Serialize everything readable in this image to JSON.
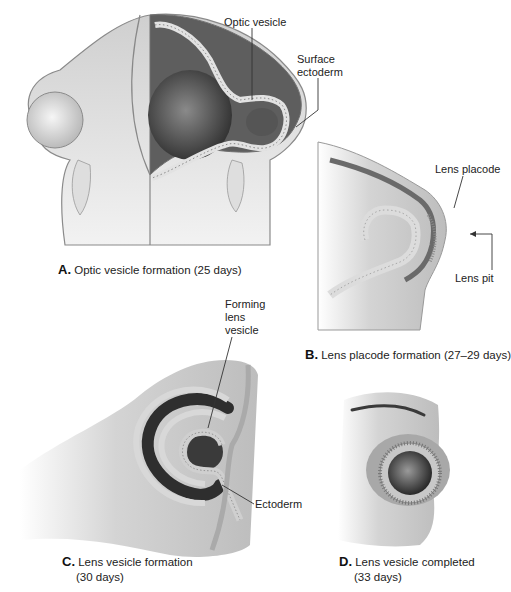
{
  "figure": {
    "panels": [
      {
        "id": "A",
        "letter": "A.",
        "caption": "Optic vesicle formation (25 days)",
        "labels": [
          "Optic vesicle",
          "Surface",
          "ectoderm"
        ]
      },
      {
        "id": "B",
        "letter": "B.",
        "caption": "Lens placode formation (27–29 days)",
        "labels": [
          "Lens placode",
          "Lens pit"
        ]
      },
      {
        "id": "C",
        "letter": "C.",
        "caption_line1": "Lens vesicle formation",
        "caption_line2": "(30 days)",
        "labels": [
          "Forming",
          "lens",
          "vesicle",
          "Ectoderm"
        ]
      },
      {
        "id": "D",
        "letter": "D.",
        "caption_line1": "Lens vesicle completed",
        "caption_line2": "(33 days)",
        "labels": []
      }
    ]
  },
  "colors": {
    "background": "#ffffff",
    "tissue_light": "#e6e6e6",
    "tissue_mid": "#b8b8b8",
    "tissue_dark": "#6e6e6e",
    "cavity": "#4a4a4a",
    "epithelium": "#dcdcdc",
    "leader_line": "#333333"
  }
}
